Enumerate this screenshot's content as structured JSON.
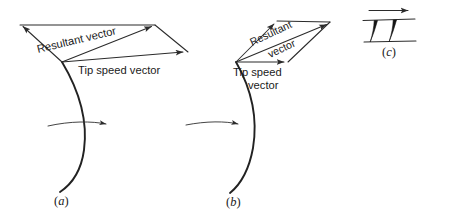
{
  "figure": {
    "title": "",
    "background_color": "#ffffff",
    "stroke_color": "#2b2b2b",
    "blade_fill_color": "#151515",
    "width": 452,
    "height": 217
  },
  "panels": [
    {
      "id": "a",
      "label": "(a)",
      "label_letter": "a",
      "description": "broad parallelogram of velocity vectors on a curved blade",
      "vectors": {
        "resultant_label": "Resultant vector",
        "tip_speed_label": "Tip speed vector"
      },
      "rotation_arrow": "rightward"
    },
    {
      "id": "b",
      "label": "(b)",
      "label_letter": "b",
      "description": "narrow parallelogram of velocity vectors on a curved blade",
      "vectors": {
        "resultant_label_line1": "Resultant",
        "resultant_label_line2": "vector",
        "tip_speed_label_line1": "Tip speed",
        "tip_speed_label_line2": "vector"
      },
      "rotation_arrow": "rightward"
    },
    {
      "id": "c",
      "label": "(c)",
      "label_letter": "c",
      "description": "blade cascade section with flow direction arrow",
      "flow_arrow": "rightward",
      "blade_count": 2
    }
  ]
}
